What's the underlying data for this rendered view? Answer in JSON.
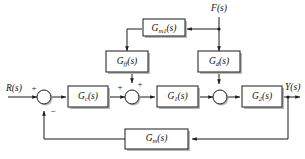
{
  "diagram": {
    "background_color": "#ffffff",
    "line_color": "#1a1a1a",
    "shadow_color": "#b9b9b9",
    "blocks": [
      {
        "id": "gm1",
        "label_main": "G",
        "label_sub": "m1",
        "label_tail": "(s)",
        "full": "Gm1(s)"
      },
      {
        "id": "gff",
        "label_main": "G",
        "label_sub": "ff",
        "label_tail": "(s)",
        "full": "Gff(s)"
      },
      {
        "id": "gd",
        "label_main": "G",
        "label_sub": "d",
        "label_tail": "(s)",
        "full": "Gd(s)"
      },
      {
        "id": "gc",
        "label_main": "G",
        "label_sub": "c",
        "label_tail": "(s)",
        "full": "Gc(s)"
      },
      {
        "id": "g1",
        "label_main": "G",
        "label_sub": "1",
        "label_tail": "(s)",
        "full": "G1(s)"
      },
      {
        "id": "g2",
        "label_main": "G",
        "label_sub": "2",
        "label_tail": "(s)",
        "full": "G2(s)"
      },
      {
        "id": "gm",
        "label_main": "G",
        "label_sub": "m",
        "label_tail": "(s)",
        "full": "Gm(s)"
      }
    ],
    "signals": {
      "reference": "R(s)",
      "disturbance": "F(s)",
      "output": "Y(s)"
    },
    "signs": {
      "sum1_input": "+",
      "sum1_feedback": "−",
      "sum2_left": "+",
      "sum2_top": "+"
    }
  }
}
